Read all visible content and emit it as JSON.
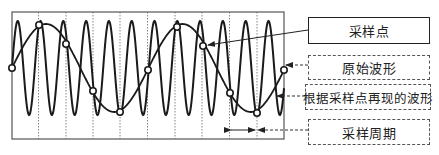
{
  "labels": {
    "sample_point": "采样点",
    "original_waveform": "原始波形",
    "reconstructed_waveform": "根据采样点再现的波形",
    "sampling_period": "采样周期"
  },
  "frame": {
    "x": 12,
    "y": 12,
    "width": 272,
    "height": 127
  },
  "sampling": {
    "grid_x": [
      38.5,
      66,
      93,
      120,
      147.5,
      175,
      202,
      229.5,
      257
    ],
    "sample_points": [
      [
        12,
        68
      ],
      [
        39,
        25
      ],
      [
        66,
        44
      ],
      [
        93,
        91
      ],
      [
        120,
        112
      ],
      [
        148,
        70
      ],
      [
        177,
        27
      ],
      [
        203,
        46
      ],
      [
        230,
        93
      ],
      [
        257,
        113
      ],
      [
        284,
        70
      ]
    ]
  },
  "original_wave": {
    "center_y": 68,
    "amplitude": 47,
    "wavelength": 22.8,
    "start_x": 12,
    "end_x": 284,
    "phase": 0
  },
  "reconstructed_wave": {
    "center_y": 68,
    "amplitude": 44,
    "wavelength": 136.5,
    "start_x": 12,
    "end_x": 284,
    "phase": 0
  },
  "colors": {
    "stroke": "#1a1a1a",
    "grid": "#666666",
    "frame": "#555555"
  }
}
